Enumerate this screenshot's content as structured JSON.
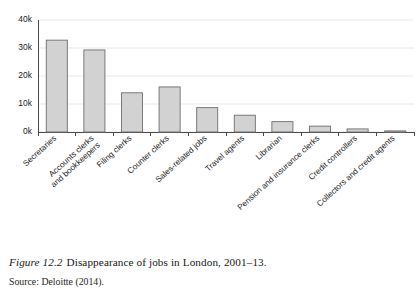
{
  "figure": {
    "label": "Figure 12.2",
    "title": "Disappearance of jobs in London, 2001–13.",
    "source": "Source: Deloitte (2014)."
  },
  "chart_data": {
    "type": "bar",
    "title": "",
    "xlabel": "",
    "ylabel": "",
    "ylim": [
      0,
      40000
    ],
    "grid": true,
    "legend": false,
    "ytick_labels": [
      "0k",
      "10k",
      "20k",
      "30k",
      "40k"
    ],
    "ytick_values": [
      0,
      10000,
      20000,
      30000,
      40000
    ],
    "categories": [
      "Secretaries",
      "Accounts clerks and bookkeepers",
      "Filing clerks",
      "Counter clerks",
      "Sales-related jobs",
      "Travel agents",
      "Librarian",
      "Pension and insurance clerks",
      "Credit controllers",
      "Collectors and credit agents"
    ],
    "category_lines": [
      [
        "Secretaries"
      ],
      [
        "Accounts clerks",
        "and bookkeepers"
      ],
      [
        "Filing clerks"
      ],
      [
        "Counter clerks"
      ],
      [
        "Sales-related jobs"
      ],
      [
        "Travel agents"
      ],
      [
        "Librarian"
      ],
      [
        "Pension and insurance clerks"
      ],
      [
        "Credit controllers"
      ],
      [
        "Collectors and credit agents"
      ]
    ],
    "values": [
      32800,
      29300,
      14000,
      16100,
      8700,
      6000,
      3700,
      2100,
      1100,
      400
    ]
  },
  "style": {
    "bar_fill": "#d2d2d2",
    "bar_border": "#6e6e6e",
    "grid_color": "#e2e2e2",
    "axis_color": "#4a4a4a",
    "background": "#ffffff"
  }
}
